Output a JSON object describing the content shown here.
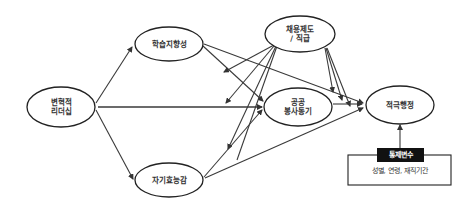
{
  "diagram": {
    "type": "path-model",
    "colors": {
      "line": "#3a3a3a",
      "node_border": "#222222",
      "control_header_bg": "#111111",
      "control_header_text": "#ffffff"
    },
    "nodes": {
      "transformational_leadership": {
        "line1": "변혁적",
        "line2": "리더십"
      },
      "learning_orientation": {
        "label": "학습지향성"
      },
      "employment_system": {
        "line1": "채용제도",
        "line2": "/ 직급"
      },
      "public_service_motivation": {
        "line1": "공공",
        "line2": "봉사동기"
      },
      "proactive_behavior": {
        "label": "적극행정"
      },
      "self_efficacy": {
        "label": "자기효능감"
      }
    },
    "control_variables": {
      "title": "통제변수",
      "items": "성별, 연령, 재직기간"
    },
    "edges": [
      {
        "from": "변혁적 리더십",
        "to": "학습지향성"
      },
      {
        "from": "변혁적 리더십",
        "to": "공공 봉사동기"
      },
      {
        "from": "변혁적 리더십",
        "to": "자기효능감"
      },
      {
        "from": "학습지향성",
        "to": "공공 봉사동기"
      },
      {
        "from": "학습지향성",
        "to": "적극행정"
      },
      {
        "from": "자기효능감",
        "to": "공공 봉사동기"
      },
      {
        "from": "자기효능감",
        "to": "적극행정"
      },
      {
        "from": "공공 봉사동기",
        "to": "적극행정"
      },
      {
        "from": "채용제도 / 직급",
        "to": "적극행정"
      },
      {
        "from": "채용제도 / 직급",
        "to": "moderation paths"
      },
      {
        "from": "통제변수",
        "to": "적극행정"
      }
    ]
  }
}
